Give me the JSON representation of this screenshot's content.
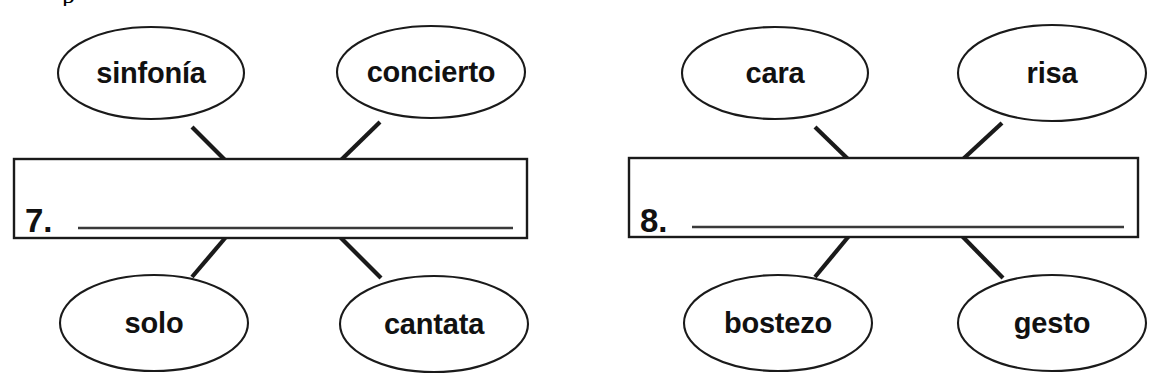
{
  "page": {
    "background_color": "#ffffff",
    "ink_color": "#1a1a1a",
    "top_cut_fragment": "p"
  },
  "exercises": [
    {
      "number_label": "7.",
      "answer_value": "",
      "answer_placeholder": "",
      "bubbles": [
        {
          "position": "top-left",
          "label": "sinfonía"
        },
        {
          "position": "top-right",
          "label": "concierto"
        },
        {
          "position": "bottom-left",
          "label": "solo"
        },
        {
          "position": "bottom-right",
          "label": "cantata"
        }
      ]
    },
    {
      "number_label": "8.",
      "answer_value": "",
      "answer_placeholder": "",
      "bubbles": [
        {
          "position": "top-left",
          "label": "cara"
        },
        {
          "position": "top-right",
          "label": "risa"
        },
        {
          "position": "bottom-left",
          "label": "bostezo"
        },
        {
          "position": "bottom-right",
          "label": "gesto"
        }
      ]
    }
  ],
  "geometry": {
    "exercise_1": {
      "box": {
        "x": 14,
        "y": 159,
        "w": 513,
        "h": 79
      },
      "number_pos": {
        "x": 25,
        "y": 231
      },
      "rule": {
        "x1": 78,
        "y1": 228,
        "x2": 513,
        "y2": 228
      },
      "ovals": [
        {
          "cx": 151,
          "cy": 73,
          "rx": 93,
          "ry": 46
        },
        {
          "cx": 431,
          "cy": 72,
          "rx": 94,
          "ry": 46
        },
        {
          "cx": 154,
          "cy": 323,
          "rx": 94,
          "ry": 48
        },
        {
          "cx": 434,
          "cy": 324,
          "rx": 94,
          "ry": 48
        }
      ],
      "connectors": [
        {
          "x1": 192,
          "y1": 127,
          "x2": 226,
          "y2": 160
        },
        {
          "x1": 380,
          "y1": 122,
          "x2": 340,
          "y2": 160
        },
        {
          "x1": 226,
          "y1": 238,
          "x2": 192,
          "y2": 277
        },
        {
          "x1": 340,
          "y1": 238,
          "x2": 381,
          "y2": 278
        }
      ]
    },
    "exercise_2": {
      "box": {
        "x": 629,
        "y": 158,
        "w": 509,
        "h": 79
      },
      "number_pos": {
        "x": 640,
        "y": 231
      },
      "rule": {
        "x1": 692,
        "y1": 227,
        "x2": 1124,
        "y2": 227
      },
      "ovals": [
        {
          "cx": 775,
          "cy": 73,
          "rx": 93,
          "ry": 46
        },
        {
          "cx": 1052,
          "cy": 73,
          "rx": 94,
          "ry": 48
        },
        {
          "cx": 778,
          "cy": 323,
          "rx": 94,
          "ry": 48
        },
        {
          "cx": 1052,
          "cy": 323,
          "rx": 94,
          "ry": 48
        }
      ],
      "connectors": [
        {
          "x1": 815,
          "y1": 127,
          "x2": 849,
          "y2": 159
        },
        {
          "x1": 1002,
          "y1": 122,
          "x2": 962,
          "y2": 159
        },
        {
          "x1": 849,
          "y1": 237,
          "x2": 815,
          "y2": 277
        },
        {
          "x1": 962,
          "y1": 237,
          "x2": 1003,
          "y2": 278
        }
      ]
    }
  }
}
